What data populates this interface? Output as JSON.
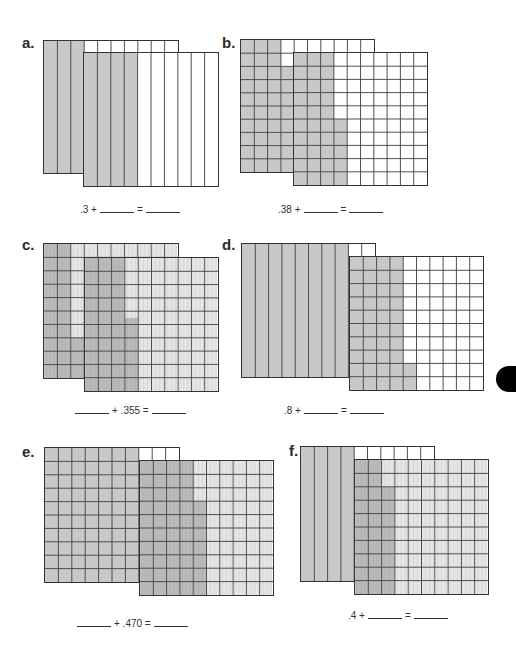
{
  "colors": {
    "shade": "#c8c8c8",
    "line": "#444444",
    "subline": "#888888",
    "paper": "#ffffff"
  },
  "problems": [
    {
      "letter": "a.",
      "equation": {
        "left": ".3 +",
        "middle": "=",
        "right": ""
      },
      "back": {
        "type": "tenths",
        "value": ".3"
      },
      "front": {
        "type": "tenths",
        "value": ".4"
      }
    },
    {
      "letter": "b.",
      "equation": {
        "left": ".38 +",
        "middle": "=",
        "right": ""
      },
      "back": {
        "type": "hundredths",
        "value": ".38"
      },
      "front": {
        "type": "hundredths",
        "value": ".35"
      }
    },
    {
      "letter": "c.",
      "equation": {
        "left": "",
        "middle": "+ .355 =",
        "right": ""
      },
      "back": {
        "type": "thousandths",
        "value": ".230"
      },
      "front": {
        "type": "thousandths",
        "value": ".355"
      }
    },
    {
      "letter": "d.",
      "equation": {
        "left": ".8 +",
        "middle": "=",
        "right": ""
      },
      "back": {
        "type": "tenths",
        "value": ".8"
      },
      "front": {
        "type": "hundredths",
        "value": ".42"
      }
    },
    {
      "letter": "e.",
      "equation": {
        "left": "",
        "middle": "+ .470 =",
        "right": ""
      },
      "back": {
        "type": "hundredths",
        "value": ".70"
      },
      "front": {
        "type": "thousandths",
        "value": ".470"
      }
    },
    {
      "letter": "f.",
      "equation": {
        "left": ".4 +",
        "middle": "=",
        "right": ""
      },
      "back": {
        "type": "tenths",
        "value": ".4"
      },
      "front": {
        "type": "thousandths",
        "value": ".280"
      }
    }
  ]
}
